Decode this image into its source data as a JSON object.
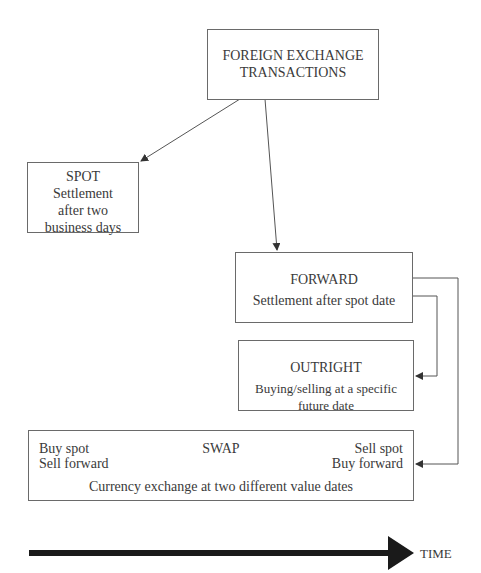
{
  "diagram": {
    "root": {
      "line1": "FOREIGN EXCHANGE",
      "line2": "TRANSACTIONS"
    },
    "spot": {
      "title": "SPOT",
      "line1": "Settlement",
      "line2": "after two",
      "line3": "business days"
    },
    "forward": {
      "title": "FORWARD",
      "desc": "Settlement after spot date"
    },
    "outright": {
      "title": "OUTRIGHT",
      "desc": "Buying/selling at a specific future date"
    },
    "swap": {
      "title": "SWAP",
      "left1": "Buy spot",
      "left2": "Sell forward",
      "right1": "Sell spot",
      "right2": "Buy forward",
      "desc": "Currency exchange at two different value dates"
    },
    "timeline": {
      "label": "TIME"
    }
  }
}
